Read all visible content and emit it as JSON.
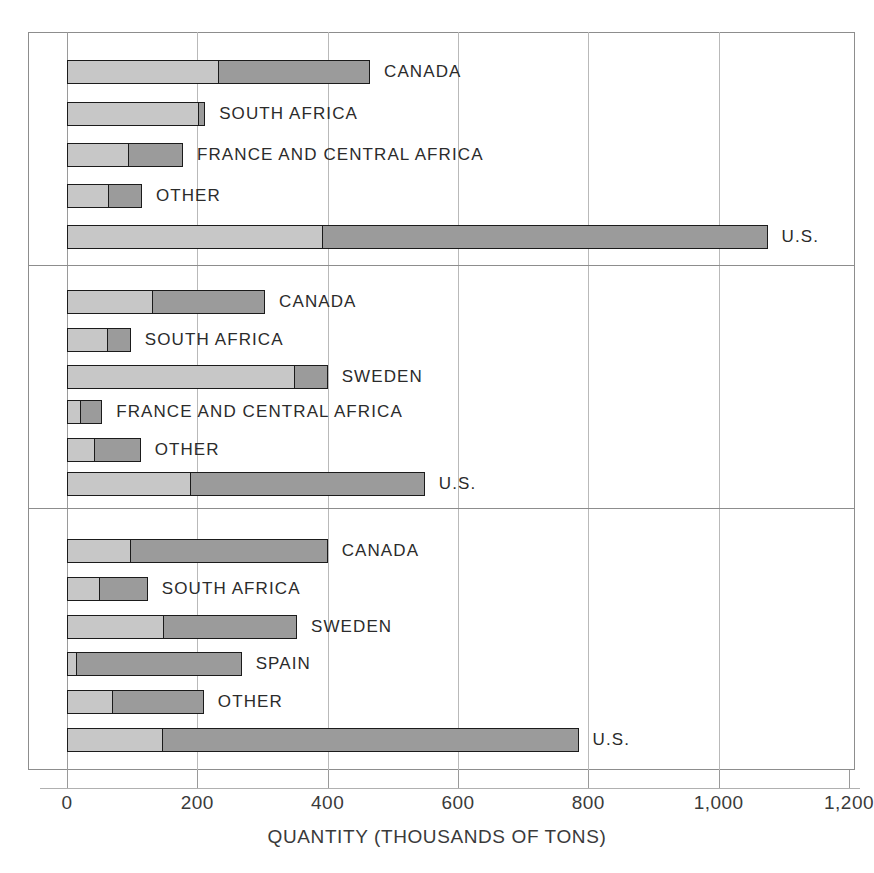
{
  "chart_data": {
    "type": "bar",
    "orientation": "horizontal",
    "stacked": true,
    "title": "",
    "xlabel": "QUANTITY (THOUSANDS OF TONS)",
    "ylabel": "",
    "xlim": [
      0,
      1200
    ],
    "xticks": [
      0,
      200,
      400,
      600,
      800,
      1000,
      1200
    ],
    "xticklabels": [
      "0",
      "200",
      "400",
      "600",
      "800",
      "1,000",
      "1,200"
    ],
    "grid": "vertical",
    "legend": "none",
    "series": [
      {
        "name": "lower-cost-segment",
        "color": "#c7c7c7"
      },
      {
        "name": "upper-cost-segment",
        "color": "#9b9b9b"
      }
    ],
    "groups": [
      {
        "label": "$10 PER TON",
        "bars": [
          {
            "label": "CANADA",
            "light": 230,
            "total": 465
          },
          {
            "label": "SOUTH AFRICA",
            "light": 200,
            "total": 212
          },
          {
            "label": "FRANCE AND CENTRAL AFRICA",
            "light": 92,
            "total": 178
          },
          {
            "label": "OTHER",
            "light": 61,
            "total": 115
          },
          {
            "label": "U.S.",
            "light": 390,
            "total": 1075
          }
        ]
      },
      {
        "label": "$10 to $15 PER TON",
        "bars": [
          {
            "label": "CANADA",
            "light": 129,
            "total": 304
          },
          {
            "label": "SOUTH AFRICA",
            "light": 60,
            "total": 98
          },
          {
            "label": "SWEDEN",
            "light": 347,
            "total": 400
          },
          {
            "label": "FRANCE AND CENTRAL AFRICA",
            "light": 19,
            "total": 54
          },
          {
            "label": "OTHER",
            "light": 40,
            "total": 113
          },
          {
            "label": "U.S.",
            "light": 187,
            "total": 549
          }
        ]
      },
      {
        "label": "$15 to $30 PER TON",
        "bars": [
          {
            "label": "CANADA",
            "light": 95,
            "total": 400
          },
          {
            "label": "SOUTH AFRICA",
            "light": 48,
            "total": 124
          },
          {
            "label": "SWEDEN",
            "light": 146,
            "total": 353
          },
          {
            "label": "SPAIN",
            "light": 12,
            "total": 268
          },
          {
            "label": "OTHER",
            "light": 68,
            "total": 210
          },
          {
            "label": "U.S.",
            "light": 144,
            "total": 785
          }
        ]
      }
    ]
  }
}
